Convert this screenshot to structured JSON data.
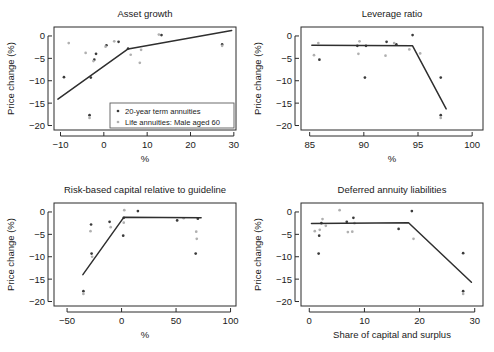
{
  "figure": {
    "legend": {
      "series_dark_label": "20-year term annuities",
      "series_light_label": "Life annuities: Male aged 60",
      "dark_color": "#3b3b3b",
      "light_color": "#b0b0b0"
    }
  },
  "chart_data": [
    {
      "id": "asset-growth",
      "type": "scatter",
      "title": "Asset growth",
      "xlabel": "%",
      "ylabel": "Price change (%)",
      "xlim": [
        -11.5,
        30.5
      ],
      "ylim": [
        -21.0,
        2.0
      ],
      "xticks": [
        -10,
        0,
        10,
        20,
        30
      ],
      "yticks": [
        0,
        -5,
        -10,
        -15,
        -20
      ],
      "grid": false,
      "legend_position": "bottom-right",
      "series": [
        {
          "name": "20-year term annuities",
          "color": "#3b3b3b",
          "points": [
            [
              -9.2,
              -9.2
            ],
            [
              -3.3,
              -17.7
            ],
            [
              -3.0,
              -9.3
            ],
            [
              -2.2,
              -5.3
            ],
            [
              -1.8,
              -4.0
            ],
            [
              0.6,
              -2.1
            ],
            [
              3.4,
              -1.3
            ],
            [
              5.6,
              -2.8
            ],
            [
              13.3,
              0.2
            ],
            [
              27.3,
              -1.9
            ]
          ]
        },
        {
          "name": "Life annuities: Male aged 60",
          "color": "#b0b0b0",
          "points": [
            [
              -8.1,
              -1.6
            ],
            [
              -3.3,
              -18.3
            ],
            [
              -4.2,
              -3.8
            ],
            [
              -2.4,
              -5.6
            ],
            [
              0.4,
              -2.4
            ],
            [
              2.4,
              -1.2
            ],
            [
              6.2,
              -4.2
            ],
            [
              8.3,
              -6.0
            ],
            [
              8.6,
              -3.1
            ],
            [
              12.7,
              0.3
            ],
            [
              27.3,
              -2.2
            ]
          ]
        }
      ],
      "fitline": [
        [
          -10.6,
          -14.1
        ],
        [
          5.6,
          -2.9
        ],
        [
          29.5,
          1.2
        ]
      ]
    },
    {
      "id": "leverage-ratio",
      "type": "scatter",
      "title": "Leverage ratio",
      "xlabel": "%",
      "ylabel": "Price change (%)",
      "xlim": [
        84.2,
        101.0
      ],
      "ylim": [
        -21.0,
        2.0
      ],
      "xticks": [
        85,
        90,
        95,
        100
      ],
      "yticks": [
        0,
        -5,
        -10,
        -15,
        -20
      ],
      "grid": false,
      "legend_position": "none",
      "series": [
        {
          "name": "20-year term annuities",
          "color": "#3b3b3b",
          "points": [
            [
              85.9,
              -5.3
            ],
            [
              89.4,
              -2.2
            ],
            [
              90.1,
              -9.3
            ],
            [
              90.2,
              -2.2
            ],
            [
              92.1,
              -1.3
            ],
            [
              93.0,
              -1.9
            ],
            [
              94.5,
              0.2
            ],
            [
              97.1,
              -9.3
            ],
            [
              97.1,
              -17.7
            ]
          ]
        },
        {
          "name": "Life annuities: Male aged 60",
          "color": "#b0b0b0",
          "points": [
            [
              85.4,
              -4.3
            ],
            [
              85.8,
              -1.6
            ],
            [
              89.5,
              -4.0
            ],
            [
              89.6,
              -1.2
            ],
            [
              92.0,
              -4.4
            ],
            [
              92.8,
              -1.6
            ],
            [
              94.2,
              -3.0
            ],
            [
              95.2,
              -3.9
            ],
            [
              97.1,
              -18.3
            ]
          ]
        }
      ],
      "fitline": [
        [
          85.2,
          -2.1
        ],
        [
          94.5,
          -2.2
        ],
        [
          97.6,
          -16.3
        ]
      ]
    },
    {
      "id": "risk-based-capital",
      "type": "scatter",
      "title": "Risk-based capital relative to guideline",
      "xlabel": "%",
      "ylabel": "Price change (%)",
      "xlim": [
        -62,
        105
      ],
      "ylim": [
        -21.0,
        2.0
      ],
      "xticks": [
        -50,
        0,
        50,
        100
      ],
      "yticks": [
        0,
        -5,
        -10,
        -15,
        -20
      ],
      "grid": false,
      "legend_position": "none",
      "series": [
        {
          "name": "20-year term annuities",
          "color": "#3b3b3b",
          "points": [
            [
              -35.0,
              -17.7
            ],
            [
              -28.0,
              -2.8
            ],
            [
              -27.5,
              -9.3
            ],
            [
              -11.0,
              -2.2
            ],
            [
              1.5,
              -5.3
            ],
            [
              2.0,
              -1.3
            ],
            [
              15.0,
              0.2
            ],
            [
              51.0,
              -1.9
            ],
            [
              68.0,
              -9.3
            ],
            [
              70.0,
              -1.5
            ]
          ]
        },
        {
          "name": "Life annuities: Male aged 60",
          "color": "#b0b0b0",
          "points": [
            [
              -35.0,
              -18.3
            ],
            [
              -28.5,
              -4.3
            ],
            [
              -27.0,
              -10.0
            ],
            [
              -10.0,
              -3.4
            ],
            [
              2.0,
              -2.4
            ],
            [
              2.5,
              0.4
            ],
            [
              57.0,
              -1.4
            ],
            [
              68.5,
              -4.4
            ],
            [
              69.0,
              -6.0
            ]
          ]
        }
      ],
      "fitline": [
        [
          -35.5,
          -14.0
        ],
        [
          2.0,
          -1.2
        ],
        [
          73.0,
          -1.3
        ]
      ]
    },
    {
      "id": "deferred-annuity-liabilities",
      "type": "scatter",
      "title": "Deferred annuity liabilities",
      "xlabel": "Share of capital and surplus",
      "ylabel": "Price change (%)",
      "xlim": [
        -1.5,
        31.5
      ],
      "ylim": [
        -21.0,
        2.0
      ],
      "xticks": [
        0,
        10,
        20,
        30
      ],
      "yticks": [
        0,
        -5,
        -10,
        -15,
        -20
      ],
      "grid": false,
      "legend_position": "none",
      "series": [
        {
          "name": "20-year term annuities",
          "color": "#3b3b3b",
          "points": [
            [
              1.7,
              -9.3
            ],
            [
              1.8,
              -5.3
            ],
            [
              2.2,
              -2.5
            ],
            [
              6.8,
              -2.2
            ],
            [
              8.0,
              -1.3
            ],
            [
              16.2,
              -3.8
            ],
            [
              18.6,
              0.2
            ],
            [
              27.9,
              -9.2
            ],
            [
              27.9,
              -17.7
            ]
          ]
        },
        {
          "name": "Life annuities: Male aged 60",
          "color": "#b0b0b0",
          "points": [
            [
              1.0,
              -4.3
            ],
            [
              1.9,
              -4.0
            ],
            [
              2.4,
              -1.6
            ],
            [
              3.0,
              -3.1
            ],
            [
              5.5,
              0.4
            ],
            [
              7.0,
              -4.5
            ],
            [
              7.8,
              -4.4
            ],
            [
              8.2,
              -2.5
            ],
            [
              18.9,
              -6.0
            ],
            [
              27.9,
              -18.3
            ]
          ]
        }
      ],
      "fitline": [
        [
          0.4,
          -2.6
        ],
        [
          18.0,
          -2.4
        ],
        [
          29.4,
          -15.7
        ]
      ]
    }
  ]
}
